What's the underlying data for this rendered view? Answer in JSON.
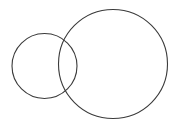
{
  "canvas": {
    "width": 182,
    "height": 126,
    "background_color": "#ffffff"
  },
  "figure": {
    "type": "geometric-diagram",
    "shape_count": 2
  },
  "chart_data": {
    "type": "scatter",
    "title": "",
    "subtitle": "",
    "xlabel": "",
    "ylabel": "",
    "grid": false,
    "legend": "none",
    "xlim": [
      0,
      182
    ],
    "ylim": [
      0,
      126
    ],
    "shapes": [
      {
        "name": "small-circle",
        "type": "circle",
        "cx": 44.5,
        "cy": 66,
        "r": 32.5,
        "stroke": "#3a3a3a",
        "stroke_width": 1.1,
        "fill": "none"
      },
      {
        "name": "large-circle",
        "type": "circle",
        "cx": 113,
        "cy": 64,
        "r": 54.5,
        "stroke": "#3a3a3a",
        "stroke_width": 1.1,
        "fill": "none"
      }
    ],
    "intersections": [
      {
        "name": "upper-intersection",
        "x": 67,
        "y": 33
      },
      {
        "name": "lower-intersection",
        "x": 66,
        "y": 93
      }
    ]
  }
}
